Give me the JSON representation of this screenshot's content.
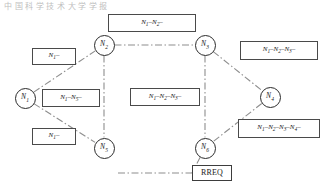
{
  "page": {
    "header_text": "中 国 科 学 技 术 大 学 学 报"
  },
  "diagram": {
    "nodes": [
      {
        "id": "n1",
        "label": "N",
        "sub": "1",
        "x": 25,
        "y": 98
      },
      {
        "id": "n2",
        "label": "N",
        "sub": "2",
        "x": 104,
        "y": 45
      },
      {
        "id": "n3",
        "label": "N",
        "sub": "3",
        "x": 205,
        "y": 45
      },
      {
        "id": "n4",
        "label": "N",
        "sub": "4",
        "x": 270,
        "y": 97
      },
      {
        "id": "n5",
        "label": "N",
        "sub": "5",
        "x": 104,
        "y": 148
      },
      {
        "id": "n6",
        "label": "N",
        "sub": "6",
        "x": 205,
        "y": 148
      }
    ],
    "edges": [
      {
        "from": "n1",
        "to": "n2",
        "style": "dash-dot"
      },
      {
        "from": "n1",
        "to": "n5",
        "style": "dash-dot"
      },
      {
        "from": "n2",
        "to": "n3",
        "style": "dash-dot"
      },
      {
        "from": "n2",
        "to": "n5",
        "style": "dash-dot"
      },
      {
        "from": "n3",
        "to": "n4",
        "style": "dash-dot"
      },
      {
        "from": "n3",
        "to": "n6",
        "style": "dash-dot"
      },
      {
        "from": "n4",
        "to": "n6",
        "style": "dash-dot"
      },
      {
        "from": "n6",
        "to": "rreq",
        "style": "dash-dot"
      }
    ],
    "path_boxes": [
      {
        "id": "top",
        "text": "N1-N2-",
        "parts": [
          "N",
          "1",
          "–",
          "N",
          "2",
          "–"
        ],
        "x": 108,
        "y": 14,
        "w": 88,
        "h": 18
      },
      {
        "id": "upper-left",
        "text": "N1-",
        "parts": [
          "N",
          "1",
          "–"
        ],
        "x": 32,
        "y": 48,
        "w": 44,
        "h": 17
      },
      {
        "id": "mid-left",
        "text": "N1-N5-",
        "parts": [
          "N",
          "1",
          "–",
          "N",
          "5",
          "–"
        ],
        "x": 42,
        "y": 89,
        "w": 58,
        "h": 18
      },
      {
        "id": "lower-left",
        "text": "N1-",
        "parts": [
          "N",
          "1",
          "–"
        ],
        "x": 32,
        "y": 128,
        "w": 44,
        "h": 17
      },
      {
        "id": "center",
        "text": "N1-N2-N3-",
        "parts": [
          "N",
          "1",
          "–",
          "N",
          "2",
          "–",
          "N",
          "3",
          "–"
        ],
        "x": 130,
        "y": 88,
        "w": 70,
        "h": 18
      },
      {
        "id": "upper-right",
        "text": "N1-N2-N3-",
        "parts": [
          "N",
          "1",
          "–",
          "N",
          "2",
          "–",
          "N",
          "3",
          "–"
        ],
        "x": 240,
        "y": 41,
        "w": 78,
        "h": 19
      },
      {
        "id": "lower-right",
        "text": "N1-N2-N3-N4-",
        "parts": [
          "N",
          "1",
          "–",
          "N",
          "2",
          "–",
          "N",
          "3",
          "–",
          "N",
          "4",
          "–"
        ],
        "x": 238,
        "y": 119,
        "w": 82,
        "h": 19
      }
    ],
    "rreq_box": {
      "label": "RREQ",
      "x": 192,
      "y": 165,
      "w": 40,
      "h": 16
    },
    "colors": {
      "node_stroke": "#2b2b2b",
      "edge_stroke": "#8e8e8e",
      "box_stroke": "#4a4a4a",
      "text": "#1a1a1a",
      "background": "#ffffff"
    }
  }
}
